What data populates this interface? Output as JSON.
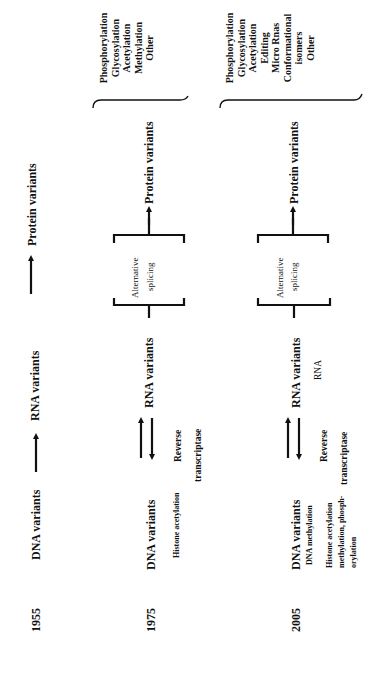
{
  "rows": [
    {
      "year": "1955",
      "dna": "DNA variants",
      "rna": "RNA variants",
      "protein": "Protein variants"
    },
    {
      "year": "1975",
      "dna": "DNA variants",
      "dna_note": "Histone acetylation",
      "rna": "RNA variants",
      "reverse_label_1": "Reverse",
      "reverse_label_2": "transcriptase",
      "splicing_1": "Alternative",
      "splicing_2": "splicing",
      "protein": "Protein variants",
      "modifications": [
        "Phosphorylation",
        "Glycosylation",
        "Acetylation",
        "Methylation",
        "Other"
      ]
    },
    {
      "year": "2005",
      "dna": "DNA variants",
      "dna_note_1": "DNA methylation",
      "dna_note_2": "Histone acetylation",
      "dna_note_3": "methylation, phosph-",
      "dna_note_4": "orylation",
      "rna": "RNA variants",
      "rna_note": "RNA",
      "reverse_label_1": "Reverse",
      "reverse_label_2": "transcriptase",
      "splicing_1": "Alternative",
      "splicing_2": "splicing",
      "protein": "Protein variants",
      "modifications": [
        "Phosphorylation",
        "Glycosylation",
        "Acetylation",
        "Editing",
        "Micro Rnas",
        "Conformational",
        "isomers",
        "Other"
      ]
    }
  ]
}
